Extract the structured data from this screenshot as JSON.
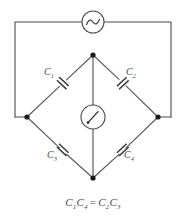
{
  "figure": {
    "background_color": "#ffffff",
    "wire_color": "#4a4a4a",
    "text_color": "#4a4a4a",
    "node_color": "#1a1a1a",
    "width": 186,
    "height": 217
  },
  "source": {
    "type": "ac-source",
    "symbol": "sine-wave",
    "label": ""
  },
  "meter": {
    "type": "galvanometer",
    "symbol": "needle-gauge",
    "label": ""
  },
  "capacitors": [
    {
      "id": "c1",
      "label": "C",
      "subscript": "1",
      "branch": "upper-left"
    },
    {
      "id": "c2",
      "label": "C",
      "subscript": "2",
      "branch": "upper-right"
    },
    {
      "id": "c3",
      "label": "C",
      "subscript": "3",
      "branch": "lower-left"
    },
    {
      "id": "c4",
      "label": "C",
      "subscript": "4",
      "branch": "lower-right"
    }
  ],
  "nodes": [
    {
      "id": "top",
      "label": ""
    },
    {
      "id": "left",
      "label": ""
    },
    {
      "id": "right",
      "label": ""
    },
    {
      "id": "bottom",
      "label": ""
    }
  ],
  "equation": {
    "left_first": "C",
    "left_first_sub": "1",
    "left_second": "C",
    "left_second_sub": "4",
    "operator": "=",
    "right_first": "C",
    "right_first_sub": "2",
    "right_second": "C",
    "right_second_sub": "3",
    "full_text": "C1C4 = C2C3"
  }
}
